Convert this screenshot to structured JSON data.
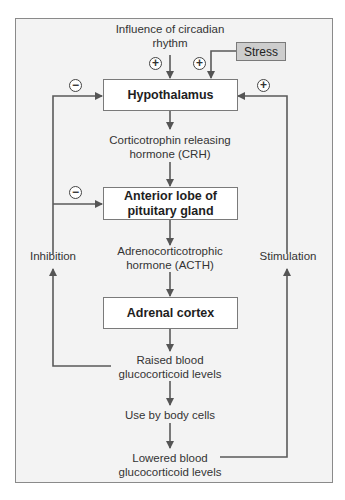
{
  "diagram": {
    "type": "feedback-loop flowchart",
    "colors": {
      "frame_background": "#f3f3f3",
      "frame_border": "#8a8a8a",
      "box_fill": "#ffffff",
      "stress_fill": "#cdcdcd",
      "arrow": "#555555"
    },
    "inputs": {
      "circadian": "Influence of circadian rhythm",
      "circadian_line1": "Influence of circadian",
      "circadian_line2": "rhythm",
      "stress": "Stress"
    },
    "nodes": {
      "hypothalamus": "Hypothalamus",
      "anterior_line1": "Anterior lobe of",
      "anterior_line2": "pituitary gland",
      "adrenal": "Adrenal cortex"
    },
    "flow_labels": {
      "crh_line1": "Corticotrophin releasing",
      "crh_line2": "hormone (CRH)",
      "acth_line1": "Adrenocorticotrophic",
      "acth_line2": "hormone (ACTH)",
      "raised_line1": "Raised blood",
      "raised_line2": "glucocorticoid levels",
      "use": "Use by body cells",
      "lowered_line1": "Lowered blood",
      "lowered_line2": "glucocorticoid levels"
    },
    "loops": {
      "left": "Inhibition",
      "right": "Stimulation"
    },
    "signs": {
      "plus": "+",
      "minus": "−"
    },
    "edges": [
      {
        "from": "Influence of circadian rhythm",
        "to": "Hypothalamus",
        "sign": "+"
      },
      {
        "from": "Stress",
        "to": "Hypothalamus",
        "sign": "+"
      },
      {
        "from": "Hypothalamus",
        "to": "Anterior lobe of pituitary gland",
        "label": "Corticotrophin releasing hormone (CRH)"
      },
      {
        "from": "Anterior lobe of pituitary gland",
        "to": "Adrenal cortex",
        "label": "Adrenocorticotrophic hormone (ACTH)"
      },
      {
        "from": "Adrenal cortex",
        "to": "Raised blood glucocorticoid levels"
      },
      {
        "from": "Raised blood glucocorticoid levels",
        "to": "Use by body cells"
      },
      {
        "from": "Use by body cells",
        "to": "Lowered blood glucocorticoid levels"
      },
      {
        "from": "Raised blood glucocorticoid levels",
        "to": "Hypothalamus",
        "sign": "−",
        "via": "Inhibition"
      },
      {
        "from": "Raised blood glucocorticoid levels",
        "to": "Anterior lobe of pituitary gland",
        "sign": "−",
        "via": "Inhibition"
      },
      {
        "from": "Lowered blood glucocorticoid levels",
        "to": "Hypothalamus",
        "sign": "+",
        "via": "Stimulation"
      }
    ]
  }
}
